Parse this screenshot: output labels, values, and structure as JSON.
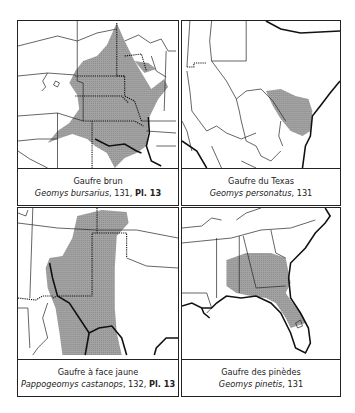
{
  "panels": [
    {
      "common_name": "Gaufre brun",
      "scientific_name": "Geomys bursarius",
      "page": ", 131, ",
      "plate": "Pl. 13",
      "region": "Central United States"
    },
    {
      "common_name": "Gaufre du Texas",
      "scientific_name": "Geomys personatus",
      "page": ", 131",
      "plate": "",
      "region": "Texas Gulf coast"
    },
    {
      "common_name": "Gaufre à face jaune",
      "scientific_name": "Pappogeomys castanops",
      "page": ", 132, ",
      "plate": "Pl. 13",
      "region": "Southern Great Plains / Texas"
    },
    {
      "common_name": "Gaufre des pinèdes",
      "scientific_name": "Geomys pinetis",
      "page": ", 131",
      "plate": "",
      "region": "Southeastern United States"
    }
  ],
  "colors": {
    "range_fill": "#9a9a9a",
    "border": "#222222",
    "background": "#ffffff"
  }
}
